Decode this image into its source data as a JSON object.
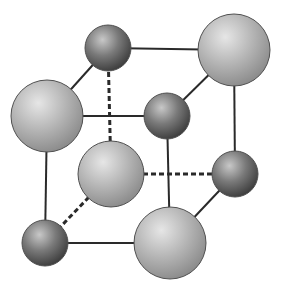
{
  "diagram": {
    "title": "",
    "type": "crystal-lattice-unit-cell",
    "colors": {
      "edge": "#2a2a2a",
      "large_atom_light": "#e6e6e6",
      "large_atom_mid": "#b4b4b4",
      "large_atom_dark": "#8c8c8c",
      "small_atom_light": "#c8c8c8",
      "small_atom_mid": "#7a7a7a",
      "small_atom_dark": "#3e3e3e",
      "outline": "#505050"
    },
    "atoms": [
      {
        "id": "back-top-left",
        "kind": "small",
        "cx": 108,
        "cy": 48,
        "r": 23
      },
      {
        "id": "back-top-right",
        "kind": "large",
        "cx": 234,
        "cy": 50,
        "r": 36
      },
      {
        "id": "back-bottom-left",
        "kind": "large",
        "cx": 111,
        "cy": 174,
        "r": 33
      },
      {
        "id": "back-bottom-right",
        "kind": "small",
        "cx": 235,
        "cy": 174,
        "r": 23
      },
      {
        "id": "front-top-left",
        "kind": "large",
        "cx": 47,
        "cy": 116,
        "r": 36
      },
      {
        "id": "front-top-right",
        "kind": "small",
        "cx": 167,
        "cy": 116,
        "r": 23
      },
      {
        "id": "front-bottom-left",
        "kind": "small",
        "cx": 45,
        "cy": 243,
        "r": 23
      },
      {
        "id": "front-bottom-right",
        "kind": "large",
        "cx": 170,
        "cy": 243,
        "r": 36
      }
    ],
    "edges": [
      {
        "from": "back-top-left",
        "to": "back-top-right",
        "style": "solid"
      },
      {
        "from": "back-top-left",
        "to": "front-top-left",
        "style": "solid"
      },
      {
        "from": "back-top-right",
        "to": "front-top-right",
        "style": "solid"
      },
      {
        "from": "front-top-left",
        "to": "front-top-right",
        "style": "solid"
      },
      {
        "from": "front-top-left",
        "to": "front-bottom-left",
        "style": "solid"
      },
      {
        "from": "front-top-right",
        "to": "front-bottom-right",
        "style": "solid"
      },
      {
        "from": "front-bottom-left",
        "to": "front-bottom-right",
        "style": "solid"
      },
      {
        "from": "back-top-right",
        "to": "back-bottom-right",
        "style": "solid"
      },
      {
        "from": "back-bottom-right",
        "to": "front-bottom-right",
        "style": "solid"
      },
      {
        "from": "back-top-left",
        "to": "back-bottom-left",
        "style": "dashed"
      },
      {
        "from": "back-bottom-left",
        "to": "back-bottom-right",
        "style": "dashed"
      },
      {
        "from": "back-bottom-left",
        "to": "front-bottom-left",
        "style": "dashed"
      }
    ]
  }
}
